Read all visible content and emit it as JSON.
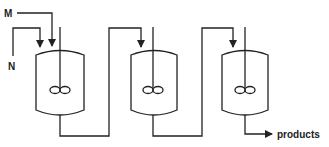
{
  "diagram": {
    "type": "process-flow",
    "inputs": [
      {
        "label": "M"
      },
      {
        "label": "N"
      }
    ],
    "reactors": [
      {
        "name": "reactor-1",
        "has_agitator": true
      },
      {
        "name": "reactor-2",
        "has_agitator": true
      },
      {
        "name": "reactor-3",
        "has_agitator": true
      }
    ],
    "output": {
      "label": "products"
    },
    "colors": {
      "line": "#222222",
      "background": "#ffffff"
    }
  }
}
